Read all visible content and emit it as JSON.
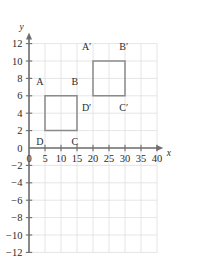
{
  "chart_data": {
    "type": "scatter",
    "title": "",
    "subtitle": "",
    "xlabel": "x",
    "ylabel": "y",
    "xlim": [
      0,
      42
    ],
    "ylim": [
      -12,
      13
    ],
    "grid": true,
    "grid_spacing_x": 5,
    "grid_spacing_y": 2,
    "legend": "none",
    "x_ticks": [
      {
        "value": 0,
        "label": "0"
      },
      {
        "value": 5,
        "label": "5"
      },
      {
        "value": 10,
        "label": "10"
      },
      {
        "value": 15,
        "label": "15"
      },
      {
        "value": 20,
        "label": "20"
      },
      {
        "value": 25,
        "label": "25"
      },
      {
        "value": 30,
        "label": "30"
      },
      {
        "value": 35,
        "label": "35"
      },
      {
        "value": 40,
        "label": "40"
      }
    ],
    "y_ticks": [
      {
        "value": 12,
        "label": "12"
      },
      {
        "value": 10,
        "label": "10"
      },
      {
        "value": 8,
        "label": "8"
      },
      {
        "value": 6,
        "label": "6"
      },
      {
        "value": 4,
        "label": "4"
      },
      {
        "value": 2,
        "label": "2"
      },
      {
        "value": 0,
        "label": "0"
      },
      {
        "value": -2,
        "label": "−2"
      },
      {
        "value": -4,
        "label": "−4"
      },
      {
        "value": -6,
        "label": "−6"
      },
      {
        "value": -8,
        "label": "−8"
      },
      {
        "value": -10,
        "label": "−10"
      },
      {
        "value": -12,
        "label": "−12"
      }
    ],
    "shapes": [
      {
        "name": "square-abcd",
        "closed": true,
        "vertices": [
          {
            "label": "A",
            "x": 5,
            "y": 6,
            "label_dx": -1.6,
            "label_dy": 1.6
          },
          {
            "label": "B",
            "x": 15,
            "y": 6,
            "label_dx": -0.7,
            "label_dy": 1.6
          },
          {
            "label": "C",
            "x": 15,
            "y": 2,
            "label_dx": -0.7,
            "label_dy": -1.3
          },
          {
            "label": "D",
            "x": 5,
            "y": 2,
            "label_dx": -1.6,
            "label_dy": -1.3
          }
        ]
      },
      {
        "name": "square-a-prime-b-prime-c-prime-d-prime",
        "closed": true,
        "vertices": [
          {
            "label": "A′",
            "x": 20,
            "y": 10,
            "label_dx": -2.0,
            "label_dy": 1.6
          },
          {
            "label": "B′",
            "x": 30,
            "y": 10,
            "label_dx": -0.4,
            "label_dy": 1.6
          },
          {
            "label": "C′",
            "x": 30,
            "y": 6,
            "label_dx": -0.4,
            "label_dy": -1.3
          },
          {
            "label": "D′",
            "x": 20,
            "y": 6,
            "label_dx": -2.0,
            "label_dy": -1.3
          }
        ]
      }
    ]
  },
  "colors": {
    "grid": "#dedede",
    "axis": "#6e6e6e",
    "shape_stroke": "#8a8a8a",
    "text": "#2b2b2b",
    "background": "#ffffff"
  }
}
